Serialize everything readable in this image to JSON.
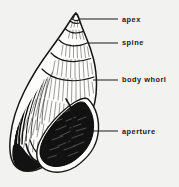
{
  "figure": {
    "background_color": "#f2f2f0",
    "ink_color": "#151515",
    "labels": [
      {
        "id": "apex",
        "text": "apex",
        "leader_line": {
          "x1": 80,
          "y1": 19,
          "x2": 118,
          "y2": 19
        }
      },
      {
        "id": "spine",
        "text": "spine",
        "leader_line": {
          "x1": 86,
          "y1": 43,
          "x2": 118,
          "y2": 43
        }
      },
      {
        "id": "body-whorl",
        "text": "body whorl",
        "leader_line": {
          "x1": 93,
          "y1": 80,
          "x2": 118,
          "y2": 80
        }
      },
      {
        "id": "aperture",
        "text": "aperture",
        "leader_line": {
          "x1": 91,
          "y1": 131,
          "x2": 118,
          "y2": 131
        }
      }
    ]
  }
}
